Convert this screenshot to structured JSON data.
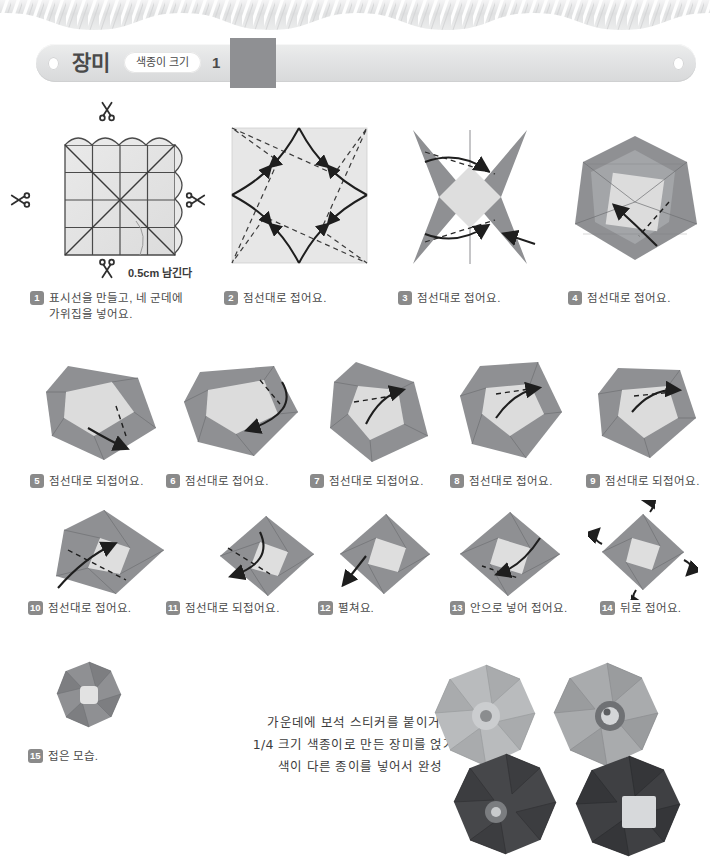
{
  "page": {
    "background_color": "#ffffff",
    "rope_border_color": "#e3e4e5"
  },
  "header": {
    "title": "장미",
    "size_label": "색종이 크기",
    "size_number": "1",
    "swatch_color": "#8f9093",
    "banner_color": "#e4e5e6"
  },
  "annotations": {
    "trim": "0.5cm 남긴다"
  },
  "steps": [
    {
      "number": "1",
      "text": "표시선을 만들고, 네 군데에\n가위집을 넣어요."
    },
    {
      "number": "2",
      "text": "점선대로 접어요."
    },
    {
      "number": "3",
      "text": "점선대로 접어요."
    },
    {
      "number": "4",
      "text": "점선대로 접어요."
    },
    {
      "number": "5",
      "text": "점선대로 되접어요."
    },
    {
      "number": "6",
      "text": "점선대로 접어요."
    },
    {
      "number": "7",
      "text": "점선대로 되접어요."
    },
    {
      "number": "8",
      "text": "점선대로 접어요."
    },
    {
      "number": "9",
      "text": "점선대로 되접어요."
    },
    {
      "number": "10",
      "text": "점선대로 접어요."
    },
    {
      "number": "11",
      "text": "점선대로 되접어요."
    },
    {
      "number": "12",
      "text": "펼쳐요."
    },
    {
      "number": "13",
      "text": "안으로 넣어 접어요."
    },
    {
      "number": "14",
      "text": "뒤로 접어요."
    },
    {
      "number": "15",
      "text": "접은 모습."
    }
  ],
  "note": {
    "line1": "가운데에 보석 스티커를 붙이거나",
    "line2": "1/4 크기 색종이로 만든 장미를 얹거나",
    "line3": "색이 다른 종이를 넣어서 완성"
  },
  "photos": [
    {
      "name": "light-rose-plain",
      "paper": "#b9bbbd"
    },
    {
      "name": "light-rose-jewel",
      "paper": "#a9abad"
    },
    {
      "name": "dark-rose-jewel",
      "paper": "#46474a"
    },
    {
      "name": "dark-rose-inset",
      "paper": "#3f4043"
    }
  ]
}
